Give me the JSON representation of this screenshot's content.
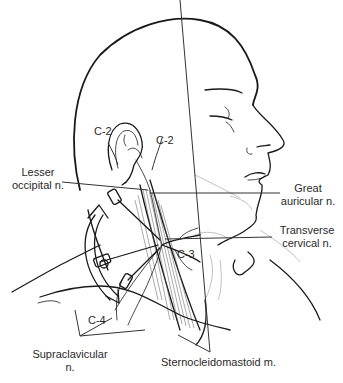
{
  "figure": {
    "labels": {
      "c2_ear": "C-2",
      "c2_neck": "C-2",
      "c3": "C-3",
      "c4": "C-4",
      "lesser_occipital": [
        "Lesser",
        "occipital n."
      ],
      "great_auricular": [
        "Great",
        "auricular n."
      ],
      "transverse_cervical": [
        "Transverse",
        "cervical n."
      ],
      "supraclavicular": [
        "Supraclavicular",
        "n."
      ],
      "sternocleidomastoid": "Sternocleidomastoid m."
    },
    "colors": {
      "ink": "#1a1a1a",
      "label_text": "#2a2a2a",
      "background": "#ffffff"
    }
  }
}
